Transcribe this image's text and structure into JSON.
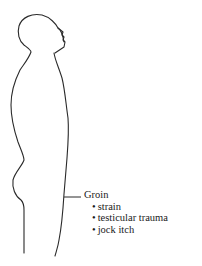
{
  "diagram": {
    "figure": "human-body-side-profile",
    "callout": {
      "region": "Groin",
      "items": [
        "strain",
        "testicular trauma",
        "jock itch"
      ],
      "bullet": "•"
    },
    "colors": {
      "outline": "#2a2a2a",
      "text": "#1a1a1a",
      "background": "#ffffff"
    }
  }
}
